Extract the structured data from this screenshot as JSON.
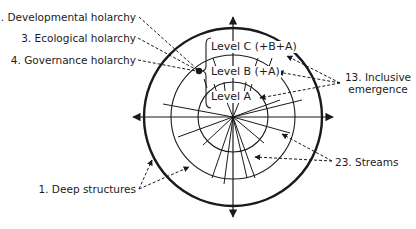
{
  "diagram": {
    "title": "",
    "levels": [
      {
        "id": "C",
        "label": "Level C (+B+A)"
      },
      {
        "id": "B",
        "label": "Level B (+A)"
      },
      {
        "id": "A",
        "label": "Level A"
      }
    ],
    "annotations": [
      {
        "id": "deep-structures",
        "label": "1. Deep structures"
      },
      {
        "id": "developmental-holarchy",
        "label": "2. Developmental holarchy"
      },
      {
        "id": "ecological-holarchy",
        "label": "3. Ecological holarchy"
      },
      {
        "id": "governance-holarchy",
        "label": "4. Governance holarchy"
      },
      {
        "id": "inclusive-emergence",
        "label_line1": "13. Inclusive",
        "label_line2": "emergence"
      },
      {
        "id": "streams",
        "label": "23. Streams"
      }
    ],
    "colors": {
      "stroke": "#1a1a1a",
      "background": "#ffffff"
    }
  }
}
